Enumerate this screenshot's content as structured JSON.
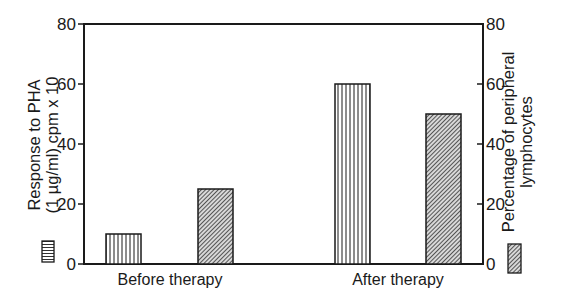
{
  "chart_data": {
    "type": "bar",
    "title": "",
    "categories": [
      "Before therapy",
      "After therapy"
    ],
    "series": [
      {
        "name": "Response to PHA (1 µg/ml) cpm x 10",
        "axis": "left",
        "pattern": "vertical-stripes",
        "values": [
          10,
          60
        ]
      },
      {
        "name": "Percentage of peripheral lymphocytes",
        "axis": "right",
        "pattern": "diagonal-hatch",
        "values": [
          25,
          50
        ]
      }
    ],
    "xlabel": "",
    "ylabel_left": [
      "Response to PHA",
      "(1 µg/ml) cpm x 10"
    ],
    "ylabel_right": [
      "Percentage of peripheral",
      "lymphocytes"
    ],
    "ylim_left": [
      0,
      80
    ],
    "ylim_right": [
      0,
      80
    ],
    "yticks_left": [
      0,
      20,
      40,
      60,
      80
    ],
    "yticks_right": [
      0,
      20,
      40,
      60,
      80
    ],
    "grid": false,
    "legend": {
      "left_swatch": "vertical-stripes",
      "right_swatch": "diagonal-hatch",
      "position": "below each y-axis title"
    }
  },
  "colors": {
    "ink": "#1a1a1a",
    "background": "#ffffff",
    "hatch_fill": "#9a9a9a"
  }
}
